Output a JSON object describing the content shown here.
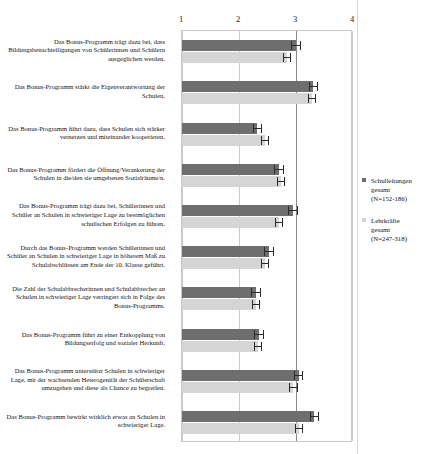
{
  "chart_data": {
    "type": "bar",
    "orientation": "horizontal",
    "title": "",
    "xlabel": "",
    "ylabel": "",
    "xlim": [
      1,
      4
    ],
    "xticks": [
      1,
      2,
      3,
      4
    ],
    "xtick_labels": [
      "1",
      "2",
      "3",
      "4"
    ],
    "grid": true,
    "legend_position": "right",
    "categories": [
      "Das Bonus-Programm trägt dazu bei, dass Bildungsbenachteiligungen von Schülerinnen und Schülern ausgeglichen werden.",
      "Das Bonus-Programm stärkt die Eigenverantwortung der Schulen.",
      "Das Bonus-Programm führt dazu, dass Schulen sich stärker vernetzen und miteinander kooperieren.",
      "Das Bonus-Programm fördert die Öffnung/Verankerung der Schulen in die/den sie umgebenen Sozialräume/n.",
      "Das Bonus-Programm trägt dazu bei, Schülerinnen und Schüler an Schulen in schwieriger Lage zu bestmöglichen schulischen Erfolgen zu führen.",
      "Durch das Bonus-Programm werden Schülerinnen und Schüler an Schulen in schwieriger Lage in höherem Maß zu Schulabschlüssen am Ende der 10. Klasse geführt.",
      "Die Zahl der Schulabbrecherinnen und Schulabbrecher an Schulen in schwieriger Lage verringert sich in Folge des Bonus-Programms.",
      "Das Bonus-Programm führt zu einer Entkopplung von Bildungserfolg und sozialer Herkunft.",
      "Das Bonus-Programm unterstützt Schulen in schwieriger Lage, mit der wachsenden Heterogenität der Schülerschaft umzugehen und diese als Chance zu begreifen.",
      "Das Bonus-Programm bewirkt wirklich etwas an Schulen in schwieriger Lage."
    ],
    "series": [
      {
        "name": "Schulleitungen gesamt (N=152-186)",
        "color": "#6e6e6e",
        "values": [
          3.0,
          3.3,
          2.32,
          2.7,
          2.95,
          2.52,
          2.3,
          2.35,
          3.05,
          3.32
        ],
        "errors": [
          0.09,
          0.08,
          0.08,
          0.09,
          0.09,
          0.09,
          0.09,
          0.09,
          0.08,
          0.08
        ]
      },
      {
        "name": "Lehrkräfte gesamt (N=247-318)",
        "color": "#d5d5d5",
        "values": [
          2.85,
          3.28,
          2.45,
          2.74,
          2.7,
          2.46,
          2.3,
          2.34,
          2.95,
          3.05
        ],
        "errors": [
          0.07,
          0.07,
          0.07,
          0.07,
          0.07,
          0.07,
          0.07,
          0.07,
          0.08,
          0.07
        ]
      }
    ]
  },
  "legend": {
    "entries": [
      {
        "line1": "Schulleitungen",
        "line2": "gesamt",
        "line3": "(N=152-186)"
      },
      {
        "line1": "Lehrkräfte",
        "line2": "gesamt",
        "line3": "(N=247-318)"
      }
    ]
  }
}
